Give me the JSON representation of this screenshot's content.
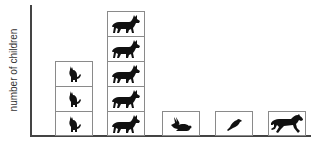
{
  "chart_data": {
    "type": "bar",
    "subtype": "pictograph",
    "title": "",
    "xlabel": "",
    "ylabel": "number of children",
    "categories": [
      "cat",
      "dog",
      "rabbit",
      "bird",
      "horse"
    ],
    "values": [
      3,
      5,
      1,
      1,
      1
    ],
    "icons": [
      "cat-icon",
      "dog-icon",
      "rabbit-icon",
      "bird-icon",
      "horse-icon"
    ],
    "ylim": [
      0,
      5
    ],
    "grid": false,
    "legend": null,
    "unit_per_icon": 1,
    "colors": {
      "icon": "#111111",
      "box_border": "#8a8a8a",
      "axis": "#444444"
    }
  }
}
